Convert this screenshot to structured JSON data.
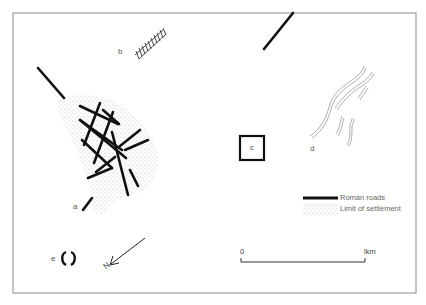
{
  "map": {
    "title": "",
    "site_labels": {
      "a": "a",
      "b": "b",
      "c": "c",
      "d": "d",
      "e": "e"
    },
    "north_label": "N",
    "legend": {
      "items": [
        {
          "symbol": "thick-black-line",
          "label": "Roman roads"
        },
        {
          "symbol": "stipple",
          "label": "Limit of settlement"
        }
      ]
    },
    "scale_bar": {
      "start_label": "0",
      "end_label": "lkm"
    },
    "colors": {
      "road": "#111111",
      "frame": "#888888",
      "stipple": "#c8c8c8",
      "feature_d": "#999999",
      "text": "#555555"
    }
  }
}
